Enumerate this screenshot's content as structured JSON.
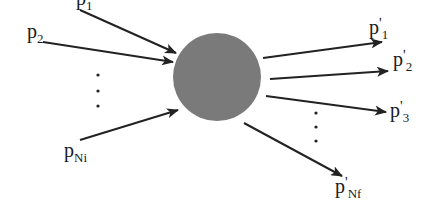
{
  "diagram": {
    "type": "scattering-process",
    "vertex": {
      "name": "interaction-blob",
      "cx": 217,
      "cy": 77,
      "r": 44,
      "fill": "#7a7a7a"
    },
    "stroke_color": "#222222",
    "incoming": [
      {
        "base": "p",
        "prime": "",
        "sub": "1",
        "x1": 80,
        "y1": 10,
        "x2": 176,
        "y2": 53,
        "lx": 76,
        "ly": 5
      },
      {
        "base": "p",
        "prime": "",
        "sub": "2",
        "x1": 43,
        "y1": 42,
        "x2": 173,
        "y2": 62,
        "lx": 27,
        "ly": 38
      },
      {
        "base": "p",
        "prime": "",
        "sub": "Ni",
        "x1": 80,
        "y1": 140,
        "x2": 178,
        "y2": 110,
        "lx": 64,
        "ly": 157
      }
    ],
    "outgoing": [
      {
        "base": "p",
        "prime": "'",
        "sub": "1",
        "x1": 263,
        "y1": 58,
        "x2": 382,
        "y2": 42,
        "lx": 369,
        "ly": 34
      },
      {
        "base": "p",
        "prime": "'",
        "sub": "2",
        "x1": 270,
        "y1": 79,
        "x2": 388,
        "y2": 71,
        "lx": 393,
        "ly": 66
      },
      {
        "base": "p",
        "prime": "'",
        "sub": "3",
        "x1": 266,
        "y1": 96,
        "x2": 386,
        "y2": 112,
        "lx": 390,
        "ly": 117
      },
      {
        "base": "p",
        "prime": "'",
        "sub": "Nf",
        "x1": 244,
        "y1": 123,
        "x2": 342,
        "y2": 176,
        "lx": 335,
        "ly": 193
      }
    ],
    "ellipsis_left": [
      [
        98,
        75
      ],
      [
        98,
        91
      ],
      [
        98,
        106
      ]
    ],
    "ellipsis_right": [
      [
        316,
        113
      ],
      [
        316,
        127
      ],
      [
        316,
        141
      ]
    ]
  }
}
